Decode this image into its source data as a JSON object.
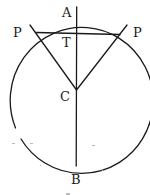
{
  "diagram": {
    "type": "geometry",
    "labels": {
      "A": "A",
      "P_left": "P",
      "P_right": "P",
      "T": "T",
      "C": "C",
      "B": "B"
    },
    "caption_fragment": "",
    "colors": {
      "ink": "#1a1a1a",
      "background": "#ffffff"
    }
  }
}
